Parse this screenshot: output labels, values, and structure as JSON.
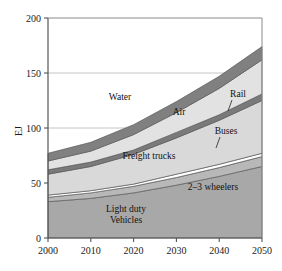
{
  "chart_data": {
    "type": "area",
    "stacked": true,
    "title": "",
    "xlabel": "",
    "ylabel": "EJ",
    "x": [
      2000,
      2010,
      2020,
      2030,
      2040,
      2050
    ],
    "xlim": [
      2000,
      2050
    ],
    "ylim": [
      0,
      200
    ],
    "xticks": [
      "2000",
      "2010",
      "2020",
      "2030",
      "2040",
      "2050"
    ],
    "yticks": [
      "0",
      "50",
      "100",
      "150",
      "200"
    ],
    "grid": "horizontal-major",
    "legend_position": "inline-annotations",
    "series": [
      {
        "name": "Light duty Vehicles",
        "color": "#a8a8a8",
        "values": [
          33,
          36,
          41,
          48,
          56,
          65
        ]
      },
      {
        "name": "2-3 wheelers",
        "color": "#b8b8b8",
        "values": [
          4,
          5,
          6,
          7,
          8,
          9
        ]
      },
      {
        "name": "Buses",
        "color": "#ffffff",
        "values": [
          2,
          2,
          2,
          3,
          3,
          3
        ]
      },
      {
        "name": "Freight trucks",
        "color": "#d9d9d9",
        "values": [
          19,
          22,
          27,
          33,
          40,
          48
        ]
      },
      {
        "name": "Rail",
        "color": "#7a7a7a",
        "values": [
          4,
          4,
          4,
          5,
          5,
          6
        ]
      },
      {
        "name": "Air",
        "color": "#e2e2e2",
        "values": [
          8,
          10,
          14,
          18,
          24,
          31
        ]
      },
      {
        "name": "Water",
        "color": "#808080",
        "values": [
          7,
          8,
          9,
          10,
          11,
          12
        ]
      }
    ],
    "annotations": [
      {
        "name": "Water",
        "text": "Water",
        "x": 120,
        "y": 100
      },
      {
        "name": "Air",
        "text": "Air",
        "x": 179,
        "y": 115
      },
      {
        "name": "Rail",
        "text": "Rail",
        "x": 238,
        "y": 97,
        "leader": true
      },
      {
        "name": "Buses",
        "text": "Buses",
        "x": 226,
        "y": 134,
        "leader": true
      },
      {
        "name": "Freight trucks",
        "text": "Freight trucks",
        "x": 149,
        "y": 159
      },
      {
        "name": "2-3 wheelers",
        "text": "2–3 wheelers",
        "x": 213,
        "y": 190
      },
      {
        "name": "Light duty",
        "text": "Light duty",
        "x": 126,
        "y": 212
      },
      {
        "name": "Vehicles",
        "text": "Vehicles",
        "x": 126,
        "y": 223
      }
    ]
  },
  "axes": {
    "y_label": "EJ",
    "y_ticks": [
      {
        "value": 200,
        "label": "200"
      },
      {
        "value": 150,
        "label": "150"
      },
      {
        "value": 100,
        "label": "100"
      },
      {
        "value": 50,
        "label": "50"
      },
      {
        "value": 0,
        "label": "0"
      }
    ],
    "x_ticks": [
      {
        "value": 2000,
        "label": "2000"
      },
      {
        "value": 2010,
        "label": "2010"
      },
      {
        "value": 2020,
        "label": "2020"
      },
      {
        "value": 2030,
        "label": "2030"
      },
      {
        "value": 2040,
        "label": "2040"
      },
      {
        "value": 2050,
        "label": "2050"
      }
    ]
  },
  "colors": {
    "axis": "#555555",
    "grid": "#b5b5b5",
    "text": "#111111",
    "band_dark": "#808080",
    "band_mid": "#a8a8a8",
    "band_light": "#d9d9d9",
    "band_white": "#ffffff",
    "band_outline": "#5a5a5a"
  }
}
